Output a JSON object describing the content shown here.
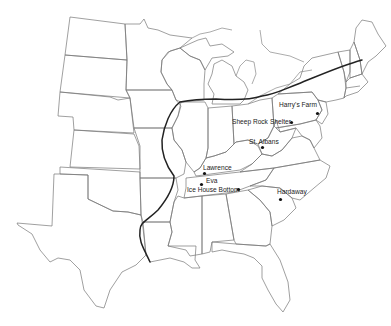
{
  "map": {
    "title": "",
    "region": "Eastern United States",
    "sites": [
      {
        "id": "harrys-farm",
        "label": "Harry's Farm"
      },
      {
        "id": "sheep-rock",
        "label": "Sheep Rock"
      },
      {
        "id": "shelter",
        "label": "Shelter"
      },
      {
        "id": "st-albans",
        "label": "St. Albans"
      },
      {
        "id": "lawrence",
        "label": "Lawrence"
      },
      {
        "id": "eva",
        "label": "Eva"
      },
      {
        "id": "ice-house-bottom",
        "label": "Ice House Bottom"
      },
      {
        "id": "hardaway",
        "label": "Hardaway"
      }
    ],
    "colors": {
      "state_lines": "#777777",
      "boundary_line": "#222222",
      "site_marker": "#111111",
      "background": "#ffffff"
    }
  }
}
